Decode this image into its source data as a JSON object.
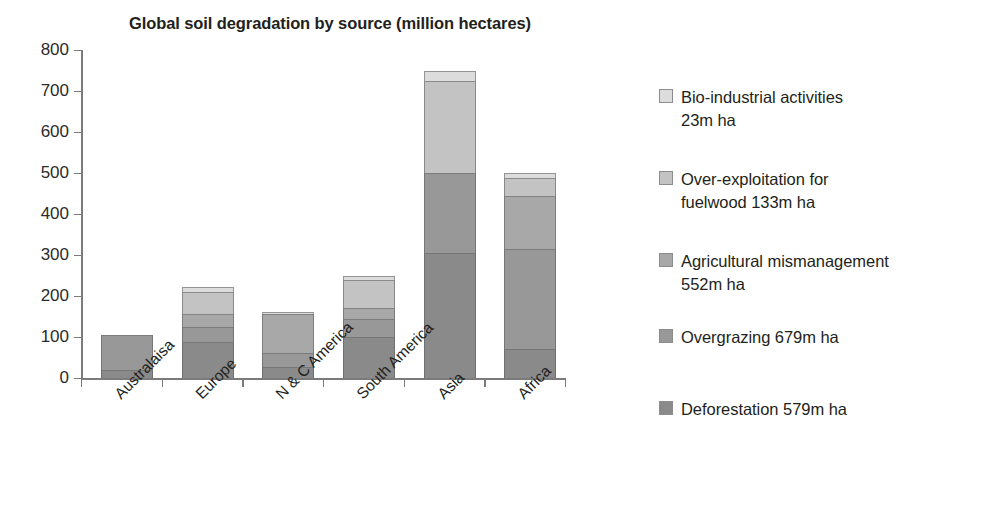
{
  "chart_data": {
    "type": "bar",
    "subtype": "stacked",
    "title": "Global soil degradation by source (million hectares)",
    "xlabel": "",
    "ylabel": "",
    "ylim": [
      0,
      800
    ],
    "yticks": [
      0,
      100,
      200,
      300,
      400,
      500,
      600,
      700,
      800
    ],
    "ytick_labels": [
      "0",
      "100",
      "200",
      "300",
      "400",
      "500",
      "600",
      "700",
      "800"
    ],
    "grid": false,
    "legend_position": "right",
    "categories": [
      "Australaisa",
      "Europe",
      "N & C America",
      "South America",
      "Asia",
      "Africa"
    ],
    "series": [
      {
        "name": "Deforestation 579m ha",
        "label": "Deforestation",
        "total": "579m ha",
        "color": "#8a8a8a",
        "values": [
          20,
          88,
          27,
          100,
          305,
          70
        ]
      },
      {
        "name": "Overgrazing 679m ha",
        "label": "Overgrazing",
        "total": "679m ha",
        "color": "#989898",
        "values": [
          85,
          37,
          33,
          45,
          195,
          245
        ]
      },
      {
        "name": "Agricultural mismanagement 552m ha",
        "label": "Agricultural mismanagement",
        "total": "552m ha",
        "color": "#a8a8a8",
        "values": [
          0,
          30,
          96,
          25,
          0,
          130
        ]
      },
      {
        "name": "Over-exploitation for fuelwood 133m ha",
        "label": "Over-exploitation for fuelwood",
        "total": "133m ha",
        "color": "#c3c3c3",
        "values": [
          0,
          55,
          0,
          68,
          225,
          43
        ]
      },
      {
        "name": "Bio-industrial activities 23m ha",
        "label": "Bio-industrial activities",
        "total": "23m ha",
        "color": "#dcdcdc",
        "values": [
          0,
          13,
          4,
          12,
          25,
          12
        ]
      }
    ],
    "totals": [
      105,
      223,
      160,
      250,
      750,
      500
    ]
  },
  "legend": {
    "items": [
      {
        "label": "Bio-industrial activities",
        "value": "23m ha",
        "color": "#dcdcdc",
        "icon": "legend-swatch-icon"
      },
      {
        "label": "Over-exploitation for",
        "value": "fuelwood 133m ha",
        "color": "#c3c3c3",
        "icon": "legend-swatch-icon"
      },
      {
        "label": "Agricultural mismanagement",
        "value": "552m ha",
        "color": "#a8a8a8",
        "icon": "legend-swatch-icon"
      },
      {
        "label": "Overgrazing 679m ha",
        "value": "",
        "color": "#989898",
        "icon": "legend-swatch-icon"
      },
      {
        "label": "Deforestation 579m ha",
        "value": "",
        "color": "#8a8a8a",
        "icon": "legend-swatch-icon"
      }
    ]
  },
  "axis": {
    "baseline_color": "#7b7b7b",
    "tick_color": "#7b7b7b"
  }
}
